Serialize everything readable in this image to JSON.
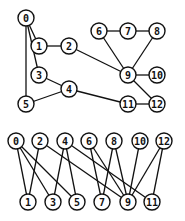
{
  "graphs": [
    {
      "name": "original-graph",
      "nodes": [
        "0",
        "1",
        "2",
        "3",
        "4",
        "5",
        "6",
        "7",
        "8",
        "9",
        "10",
        "11",
        "12"
      ],
      "edges": [
        [
          "0",
          "1"
        ],
        [
          "0",
          "3"
        ],
        [
          "0",
          "5"
        ],
        [
          "1",
          "2"
        ],
        [
          "2",
          "9"
        ],
        [
          "3",
          "4"
        ],
        [
          "4",
          "5"
        ],
        [
          "4",
          "11"
        ],
        [
          "6",
          "7"
        ],
        [
          "6",
          "9"
        ],
        [
          "7",
          "8"
        ],
        [
          "8",
          "9"
        ],
        [
          "9",
          "10"
        ],
        [
          "9",
          "12"
        ],
        [
          "11",
          "12"
        ]
      ]
    },
    {
      "name": "bipartite-layout",
      "top_row": [
        "0",
        "2",
        "4",
        "6",
        "8",
        "10",
        "12"
      ],
      "bottom_row": [
        "1",
        "3",
        "5",
        "7",
        "9",
        "11"
      ],
      "edges": [
        [
          "0",
          "1"
        ],
        [
          "0",
          "3"
        ],
        [
          "0",
          "5"
        ],
        [
          "2",
          "1"
        ],
        [
          "2",
          "9"
        ],
        [
          "4",
          "3"
        ],
        [
          "4",
          "5"
        ],
        [
          "4",
          "11"
        ],
        [
          "6",
          "7"
        ],
        [
          "6",
          "9"
        ],
        [
          "8",
          "7"
        ],
        [
          "8",
          "9"
        ],
        [
          "10",
          "9"
        ],
        [
          "12",
          "9"
        ],
        [
          "12",
          "11"
        ]
      ]
    }
  ],
  "colors": {
    "stroke": "#111111",
    "fill": "#ffffff"
  }
}
